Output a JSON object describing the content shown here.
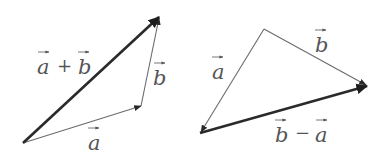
{
  "diagram": {
    "colors": {
      "thin_line": "#6b6b6b",
      "thick_line": "#2a2a2a",
      "text": "#555555",
      "background": "#ffffff"
    },
    "left_figure": {
      "name": "vector-sum",
      "vertices": {
        "origin": [
          23,
          143
        ],
        "a_tip": [
          141,
          106
        ],
        "b_tip": [
          159,
          17
        ]
      },
      "vectors": [
        {
          "id": "a",
          "from": "origin",
          "to": "a_tip",
          "weight": "thin",
          "label": "a"
        },
        {
          "id": "b",
          "from": "a_tip",
          "to": "b_tip",
          "weight": "thin",
          "label": "b"
        },
        {
          "id": "a_plus_b",
          "from": "origin",
          "to": "b_tip",
          "weight": "thick",
          "label": "a + b"
        }
      ],
      "labels": {
        "sum_a": "a",
        "sum_op": "+",
        "sum_b": "b",
        "side_b": "b",
        "side_a": "a"
      }
    },
    "right_figure": {
      "name": "vector-difference",
      "vertices": {
        "apex": [
          264,
          29
        ],
        "b_tip": [
          367,
          86
        ],
        "a_tip": [
          200,
          133
        ]
      },
      "vectors": [
        {
          "id": "a",
          "from": "apex",
          "to": "a_tip",
          "weight": "thin",
          "label": "a"
        },
        {
          "id": "b",
          "from": "apex",
          "to": "b_tip",
          "weight": "thin",
          "label": "b"
        },
        {
          "id": "b_minus_a",
          "from": "a_tip",
          "to": "b_tip",
          "weight": "thick",
          "label": "b − a"
        }
      ],
      "labels": {
        "side_a": "a",
        "side_b": "b",
        "diff_b": "b",
        "diff_op": "−",
        "diff_a": "a"
      }
    }
  }
}
